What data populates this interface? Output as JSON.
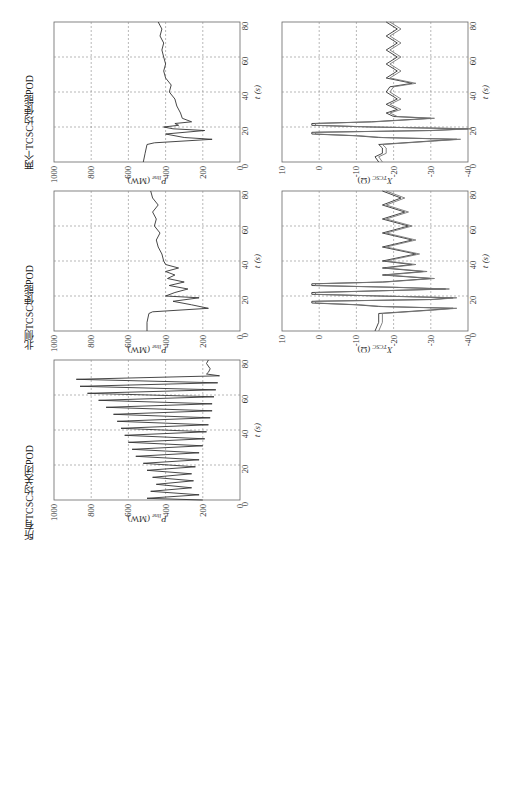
{
  "figure": {
    "panels": [
      {
        "id": "p_both",
        "title": "两个TCSC均使能POD"
      },
      {
        "id": "p_north",
        "title": "北侧TCSC使能POD"
      },
      {
        "id": "p_off",
        "title": "所有TCSC均关闭POD"
      }
    ],
    "p_axis": {
      "ylabel": "P_line (MW)",
      "ylabel_main": "P",
      "ylabel_sub": "line",
      "ylabel_unit": "(MW)",
      "yticks": [
        "0",
        "200",
        "400",
        "600",
        "800",
        "1000"
      ]
    },
    "x_axis": {
      "ylabel_main": "X",
      "ylabel_sub": "TCSC",
      "ylabel_unit": "(Ω)",
      "yticks": [
        "-40",
        "-30",
        "-20",
        "-10",
        "0",
        "10"
      ]
    },
    "t_axis": {
      "xlabel": "t (s)",
      "xticks": [
        "0",
        "20",
        "40",
        "60",
        "80"
      ]
    }
  },
  "chart_data": [
    {
      "type": "line",
      "title": "两个TCSC均使能POD",
      "xlabel": "t (s)",
      "ylabel": "P_line (MW)",
      "xlim": [
        0,
        80
      ],
      "ylim": [
        0,
        1000
      ],
      "grid": true,
      "x": [
        0,
        5,
        10,
        11,
        13,
        14,
        16,
        18,
        19,
        20,
        21,
        22,
        23,
        25,
        28,
        32,
        36,
        40,
        44,
        48,
        52,
        56,
        60,
        64,
        68,
        72,
        76,
        80
      ],
      "series": [
        {
          "name": "P_line",
          "values": [
            520,
            510,
            500,
            460,
            150,
            300,
            400,
            190,
            360,
            410,
            330,
            350,
            260,
            310,
            320,
            340,
            350,
            380,
            370,
            400,
            410,
            400,
            410,
            420,
            410,
            430,
            420,
            440
          ]
        }
      ]
    },
    {
      "type": "line",
      "title": "北侧TCSC使能POD",
      "xlabel": "t (s)",
      "ylabel": "P_line (MW)",
      "xlim": [
        0,
        80
      ],
      "ylim": [
        0,
        1000
      ],
      "grid": true,
      "x": [
        0,
        5,
        10,
        11,
        13,
        15,
        17,
        19,
        20,
        22,
        24,
        26,
        28,
        30,
        32,
        34,
        36,
        38,
        40,
        44,
        48,
        52,
        56,
        60,
        64,
        68,
        72,
        76,
        80
      ],
      "series": [
        {
          "name": "P_line",
          "values": [
            500,
            500,
            490,
            470,
            170,
            260,
            360,
            220,
            400,
            350,
            280,
            380,
            300,
            390,
            350,
            400,
            330,
            400,
            410,
            420,
            440,
            450,
            430,
            460,
            450,
            470,
            440,
            470,
            480
          ]
        }
      ]
    },
    {
      "type": "line",
      "title": "所有TCSC均关闭POD",
      "xlabel": "t (s)",
      "ylabel": "P_line (MW)",
      "xlim": [
        0,
        80
      ],
      "ylim": [
        0,
        1000
      ],
      "grid": true,
      "x": [
        0,
        1,
        3,
        5,
        7,
        9,
        11,
        13,
        15,
        17,
        19,
        21,
        23,
        25,
        27,
        29,
        31,
        33,
        35,
        37,
        39,
        41,
        43,
        45,
        47,
        49,
        51,
        53,
        55,
        57,
        59,
        61,
        63,
        65,
        67,
        69,
        71,
        72,
        73,
        75,
        78,
        80
      ],
      "series": [
        {
          "name": "P_line",
          "values": [
            200,
            500,
            220,
            480,
            260,
            450,
            250,
            470,
            260,
            500,
            240,
            520,
            220,
            560,
            220,
            580,
            200,
            600,
            190,
            620,
            180,
            640,
            170,
            660,
            160,
            680,
            150,
            720,
            150,
            760,
            140,
            820,
            130,
            860,
            120,
            880,
            110,
            180,
            170,
            160,
            180,
            170
          ]
        }
      ]
    },
    {
      "type": "line",
      "title": "两个TCSC均使能POD",
      "xlabel": "t (s)",
      "ylabel": "X_TCSC (Ω)",
      "xlim": [
        0,
        80
      ],
      "ylim": [
        -40,
        10
      ],
      "grid": true,
      "x": [
        0,
        3,
        5,
        8,
        10,
        12,
        13,
        14,
        15,
        16,
        17,
        18,
        19,
        20,
        21,
        22,
        23,
        25,
        26,
        28,
        30,
        33,
        36,
        40,
        43,
        45,
        48,
        52,
        56,
        60,
        64,
        68,
        72,
        76,
        80
      ],
      "series": [
        {
          "name": "X_TCSC1",
          "values": [
            -16,
            -15,
            -17,
            -17,
            -16,
            -30,
            -37,
            -16,
            -10,
            2,
            2,
            -30,
            -40,
            -14,
            2,
            2,
            -14,
            -30,
            -20,
            -18,
            -21,
            -18,
            -21,
            -18,
            -19,
            -25,
            -18,
            -21,
            -18,
            -21,
            -18,
            -21,
            -18,
            -21,
            -18
          ]
        },
        {
          "name": "X_TCSC2",
          "values": [
            -17,
            -16,
            -18,
            -18,
            -17,
            -31,
            -38,
            -17,
            -11,
            1,
            1,
            -31,
            -41,
            -15,
            1,
            1,
            -15,
            -31,
            -21,
            -19,
            -22,
            -19,
            -22,
            -19,
            -20,
            -26,
            -19,
            -22,
            -19,
            -22,
            -19,
            -22,
            -19,
            -22,
            -19
          ]
        }
      ]
    },
    {
      "type": "line",
      "title": "北侧TCSC使能POD",
      "xlabel": "t (s)",
      "ylabel": "X_TCSC (Ω)",
      "xlim": [
        0,
        80
      ],
      "ylim": [
        -40,
        10
      ],
      "grid": true,
      "x": [
        0,
        5,
        10,
        12,
        13,
        14,
        15,
        16,
        17,
        18,
        19,
        20,
        21,
        22,
        23,
        24,
        25,
        26,
        27,
        28,
        30,
        32,
        34,
        36,
        38,
        40,
        44,
        48,
        52,
        56,
        60,
        64,
        68,
        72,
        76,
        80
      ],
      "series": [
        {
          "name": "X_TCSC1",
          "values": [
            -15,
            -16,
            -16,
            -30,
            -36,
            -16,
            -10,
            2,
            2,
            -30,
            -36,
            -16,
            2,
            2,
            -16,
            -34,
            -20,
            2,
            2,
            -17,
            -30,
            -17,
            -28,
            -17,
            -25,
            -17,
            -26,
            -17,
            -25,
            -17,
            -24,
            -17,
            -23,
            -17,
            -22,
            -17
          ]
        },
        {
          "name": "X_TCSC2",
          "values": [
            -16,
            -17,
            -17,
            -31,
            -37,
            -17,
            -11,
            1,
            1,
            -31,
            -37,
            -17,
            1,
            1,
            -17,
            -35,
            -21,
            1,
            1,
            -18,
            -31,
            -18,
            -29,
            -18,
            -26,
            -18,
            -27,
            -18,
            -26,
            -18,
            -25,
            -18,
            -24,
            -18,
            -23,
            -18
          ]
        }
      ]
    }
  ]
}
